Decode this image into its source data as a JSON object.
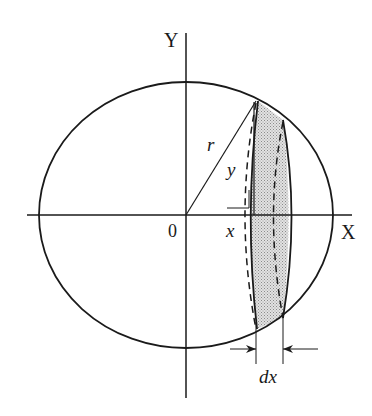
{
  "diagram": {
    "type": "circle-cross-section",
    "axes": {
      "x_label": "X",
      "y_label": "Y",
      "origin_label": "0"
    },
    "labels": {
      "radius": "r",
      "height": "y",
      "position": "x",
      "width": "dx"
    },
    "colors": {
      "stroke": "#1a1a1a",
      "slice_fill": "#c8c8c8",
      "background": "#ffffff"
    }
  }
}
